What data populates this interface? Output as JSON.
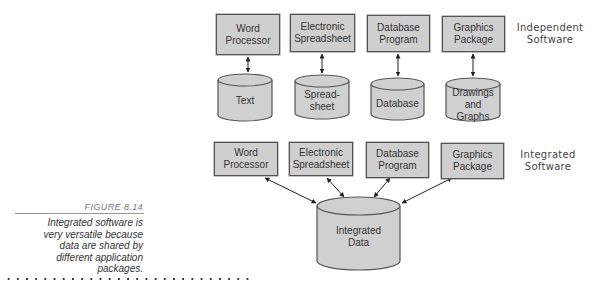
{
  "figure": {
    "number": "FIGURE 8.14",
    "caption_lines": [
      "Integrated software is",
      "very versatile because",
      "data are shared by",
      "different application",
      "packages."
    ]
  },
  "independent": {
    "label_lines": [
      "Independent",
      "Software"
    ],
    "programs": [
      {
        "lines": [
          "Word",
          "Processor"
        ]
      },
      {
        "lines": [
          "Electronic",
          "Spreadsheet"
        ]
      },
      {
        "lines": [
          "Database",
          "Program"
        ]
      },
      {
        "lines": [
          "Graphics",
          "Package"
        ]
      }
    ],
    "data_stores": [
      {
        "lines": [
          "Text"
        ]
      },
      {
        "lines": [
          "Spread-",
          "sheet"
        ]
      },
      {
        "lines": [
          "Database"
        ]
      },
      {
        "lines": [
          "Drawings",
          "and",
          "Graphs"
        ]
      }
    ]
  },
  "integrated": {
    "label_lines": [
      "Integrated",
      "Software"
    ],
    "programs": [
      {
        "lines": [
          "Word",
          "Processor"
        ]
      },
      {
        "lines": [
          "Electronic",
          "Spreadsheet"
        ]
      },
      {
        "lines": [
          "Database",
          "Program"
        ]
      },
      {
        "lines": [
          "Graphics",
          "Package"
        ]
      }
    ],
    "data_store": {
      "lines": [
        "Integrated",
        "Data"
      ]
    }
  },
  "colors": {
    "box_fill": "#cfcfcf",
    "cylinder_fill": "#d0d0d0",
    "stroke": "#555555"
  }
}
